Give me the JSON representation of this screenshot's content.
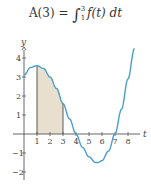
{
  "formula": {
    "lhs": "A(3) = ",
    "integral": "∫",
    "lower": "1",
    "upper": "3",
    "integrand": "f(t) dt"
  },
  "chart_data": {
    "type": "line",
    "xlabel": "t",
    "ylabel": "y",
    "x_ticks": [
      "1",
      "2",
      "3",
      "4",
      "5",
      "6",
      "7",
      "8"
    ],
    "y_ticks": [
      "4",
      "3",
      "2",
      "1",
      "−1",
      "−2"
    ],
    "xlim": [
      0,
      8.6
    ],
    "ylim": [
      -2.2,
      4.6
    ],
    "grid": false,
    "series": [
      {
        "name": "f(t)",
        "color": "#4a9fc8",
        "x": [
          0,
          0.5,
          1,
          1.5,
          2,
          2.5,
          3,
          3.5,
          4,
          4.5,
          5,
          5.5,
          5.7,
          6,
          6.5,
          7,
          7.5,
          8,
          8.5
        ],
        "y": [
          3.1,
          3.5,
          3.6,
          3.45,
          3.0,
          2.4,
          1.6,
          0.8,
          0.0,
          -0.7,
          -1.2,
          -1.5,
          -1.5,
          -1.4,
          -0.9,
          0.0,
          1.3,
          2.9,
          4.5
        ]
      }
    ],
    "shaded_region": {
      "from": 1,
      "to": 3,
      "color": "#e8dfcf",
      "meaning": "A(3)"
    }
  }
}
